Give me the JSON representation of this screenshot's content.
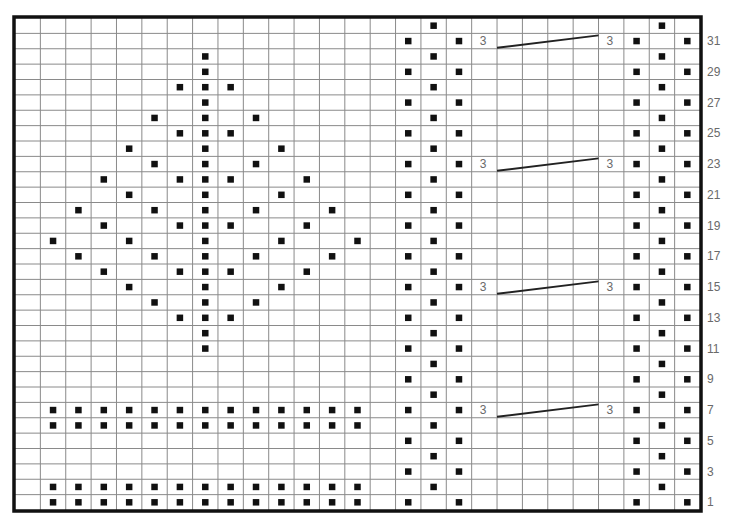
{
  "chart": {
    "title": "",
    "cols": 27,
    "rows": 32,
    "colors": {
      "grid_line": "#8a8a8a",
      "border": "#111111",
      "stitch": "#111111",
      "label": "#6a6a6a",
      "background": "#ffffff"
    },
    "symbol_key": {
      "dot": "filled black square (purl / texture stitch)",
      "cable": "3-over-3 cable cross"
    },
    "row_labels": [
      "31",
      "29",
      "27",
      "25",
      "23",
      "21",
      "19",
      "17",
      "15",
      "13",
      "11",
      "9",
      "7",
      "5",
      "3",
      "1"
    ],
    "left_motif": {
      "name": "diamond-lattice",
      "rows": {
        "30": [
          7
        ],
        "29": [
          7
        ],
        "28": [
          6,
          7,
          8
        ],
        "27": [
          7
        ],
        "26": [
          5,
          7,
          9
        ],
        "25": [
          6,
          7,
          8
        ],
        "24": [
          4,
          7,
          10
        ],
        "23": [
          5,
          7,
          9
        ],
        "22": [
          3,
          6,
          7,
          8,
          11
        ],
        "21": [
          4,
          7,
          10
        ],
        "20": [
          2,
          5,
          7,
          9,
          12
        ],
        "19": [
          3,
          6,
          7,
          8,
          11
        ],
        "18": [
          1,
          4,
          7,
          10,
          13
        ],
        "17": [
          2,
          5,
          7,
          9,
          12
        ],
        "16": [
          3,
          6,
          7,
          8,
          11
        ],
        "15": [
          4,
          7,
          10
        ],
        "14": [
          5,
          7,
          9
        ],
        "13": [
          6,
          7,
          8
        ],
        "12": [
          7
        ],
        "11": [
          7
        ],
        "7": [
          1,
          2,
          3,
          4,
          5,
          6,
          7,
          8,
          9,
          10,
          11,
          12,
          13
        ],
        "6": [
          1,
          2,
          3,
          4,
          5,
          6,
          7,
          8,
          9,
          10,
          11,
          12,
          13
        ],
        "2": [
          1,
          2,
          3,
          4,
          5,
          6,
          7,
          8,
          9,
          10,
          11,
          12,
          13
        ],
        "1": [
          1,
          2,
          3,
          4,
          5,
          6,
          7,
          8,
          9,
          10,
          11,
          12,
          13
        ]
      }
    },
    "zigzag_panels": {
      "odd_row_cols": [
        15,
        17,
        24,
        26
      ],
      "even_row_cols": [
        16,
        25
      ]
    },
    "cables": [
      {
        "row": 31,
        "label_left": "3",
        "label_right": "3",
        "label_left_col": 18,
        "label_right_col": 23,
        "line_from_col": 19,
        "line_to_col": 23
      },
      {
        "row": 23,
        "label_left": "3",
        "label_right": "3",
        "label_left_col": 18,
        "label_right_col": 23,
        "line_from_col": 19,
        "line_to_col": 23
      },
      {
        "row": 15,
        "label_left": "3",
        "label_right": "3",
        "label_left_col": 18,
        "label_right_col": 23,
        "line_from_col": 19,
        "line_to_col": 23
      },
      {
        "row": 7,
        "label_left": "3",
        "label_right": "3",
        "label_left_col": 18,
        "label_right_col": 23,
        "line_from_col": 19,
        "line_to_col": 23
      }
    ]
  }
}
